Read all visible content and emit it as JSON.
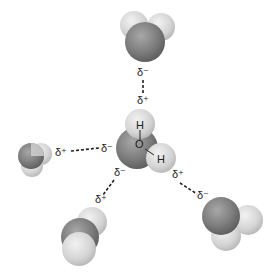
{
  "diagram": {
    "title": "",
    "colors": {
      "oxygen": "#7a7a7a",
      "hydrogen": "#d8d8d8",
      "bond_line": "#222222",
      "background": "#ffffff"
    },
    "central_molecule": {
      "oxygen_label": "O",
      "hydrogen_top_label": "H",
      "hydrogen_right_label": "H"
    },
    "charges": {
      "top_neighbor_oxygen": "δ⁻",
      "central_top_hydrogen": "δ⁺",
      "left_neighbor_hydrogen": "δ⁺",
      "central_oxygen_left": "δ⁻",
      "central_oxygen_bottom": "δ⁻",
      "bottom_left_neighbor_hydrogen": "δ⁺",
      "central_right_hydrogen": "δ⁺",
      "bottom_right_neighbor_oxygen": "δ⁻"
    },
    "hydrogen_bonds": [
      {
        "from": "top_neighbor_oxygen",
        "to": "central_top_hydrogen"
      },
      {
        "from": "left_neighbor_hydrogen",
        "to": "central_oxygen_left"
      },
      {
        "from": "central_oxygen_bottom",
        "to": "bottom_left_neighbor_hydrogen"
      },
      {
        "from": "central_right_hydrogen",
        "to": "bottom_right_neighbor_oxygen"
      }
    ]
  }
}
